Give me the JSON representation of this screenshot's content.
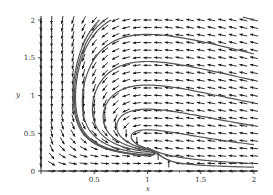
{
  "chart_data": {
    "type": "direction_field",
    "title": "",
    "xlabel": "x",
    "ylabel": "y",
    "xlim": [
      0,
      2
    ],
    "ylim": [
      0,
      2
    ],
    "x_ticks": [
      {
        "value": 0.5,
        "label": "0.5"
      },
      {
        "value": 1,
        "label": "1"
      },
      {
        "value": 1.5,
        "label": "1.5"
      },
      {
        "value": 2,
        "label": "2"
      }
    ],
    "y_ticks": [
      {
        "value": 0,
        "label": "0"
      },
      {
        "value": 0.5,
        "label": "0.5"
      },
      {
        "value": 1,
        "label": "1"
      },
      {
        "value": 1.5,
        "label": "1.5"
      },
      {
        "value": 2,
        "label": "2"
      }
    ],
    "grid": false,
    "legend": null,
    "arrow_grid": {
      "nx": 20,
      "ny": 20
    },
    "equilibrium": {
      "x": 1.0,
      "y": 0.3
    },
    "field_model": {
      "dx": "x*(1.3 - x - y)",
      "dy": "y*(x - 1)"
    },
    "trajectory_starts": [
      {
        "x": 0.55,
        "y": 2.0
      },
      {
        "x": 0.6,
        "y": 2.0
      },
      {
        "x": 0.66,
        "y": 2.0
      },
      {
        "x": 2.0,
        "y": 2.0
      },
      {
        "x": 2.0,
        "y": 1.55
      },
      {
        "x": 2.0,
        "y": 1.2
      },
      {
        "x": 2.0,
        "y": 0.9
      },
      {
        "x": 2.0,
        "y": 0.6
      },
      {
        "x": 2.0,
        "y": 0.35
      },
      {
        "x": 2.0,
        "y": 0.1
      },
      {
        "x": 2.0,
        "y": 0.05
      }
    ],
    "colors": {
      "arrow": "#1a1a1a",
      "trajectory": "#555555",
      "axis": "#222222"
    }
  }
}
